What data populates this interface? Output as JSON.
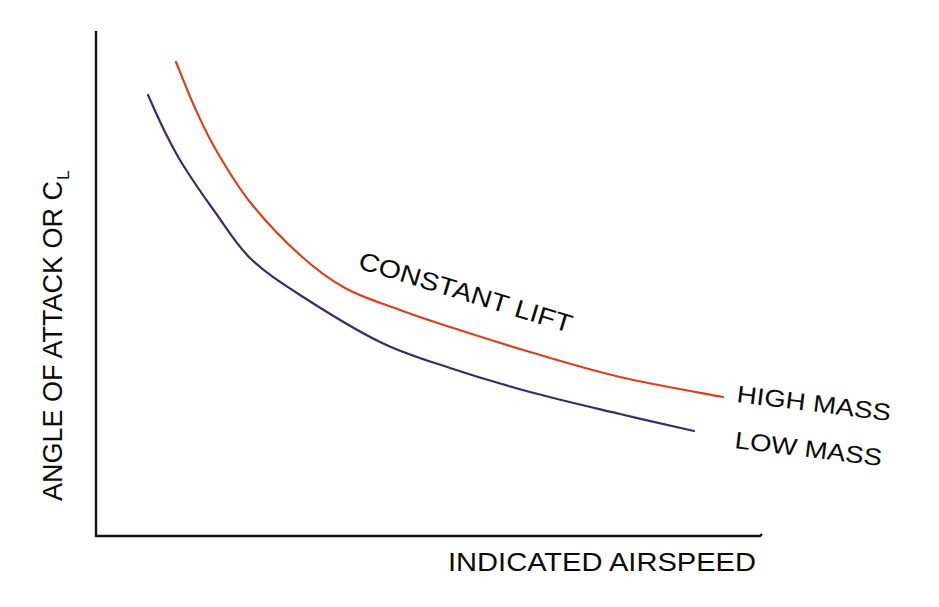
{
  "chart_data": {
    "type": "line",
    "title": "",
    "xlabel": "INDICATED AIRSPEED",
    "ylabel": "ANGLE OF ATTACK OR C",
    "ylabel_subscript": "L",
    "grid": false,
    "legend": "inline labels at curve ends",
    "annotations": [
      {
        "text": "CONSTANT LIFT",
        "position": "above high-mass curve, mid-chart",
        "rotation_deg": 17
      }
    ],
    "axis_ticks": "none (qualitative diagram)",
    "series": [
      {
        "name": "HIGH MASS",
        "color": "#d8401f",
        "points_px": [
          [
            176,
            62
          ],
          [
            195,
            108
          ],
          [
            216,
            150
          ],
          [
            250,
            202
          ],
          [
            300,
            255
          ],
          [
            345,
            288
          ],
          [
            400,
            310
          ],
          [
            450,
            327
          ],
          [
            530,
            352
          ],
          [
            620,
            377
          ],
          [
            723,
            397
          ]
        ]
      },
      {
        "name": "LOW MASS",
        "color": "#3d2a6b",
        "points_px": [
          [
            148,
            95
          ],
          [
            165,
            132
          ],
          [
            183,
            165
          ],
          [
            215,
            212
          ],
          [
            250,
            258
          ],
          [
            300,
            295
          ],
          [
            380,
            342
          ],
          [
            450,
            368
          ],
          [
            530,
            392
          ],
          [
            620,
            414
          ],
          [
            694,
            431
          ]
        ]
      }
    ],
    "relationship": "angle of attack decreases as indicated airspeed increases; higher mass requires higher angle of attack at a given airspeed"
  },
  "labels": {
    "x_axis": "INDICATED AIRSPEED",
    "y_axis_main": "ANGLE OF ATTACK OR C",
    "y_axis_sub": "L",
    "annotation": "CONSTANT LIFT",
    "high_mass": "HIGH MASS",
    "low_mass": "LOW MASS"
  },
  "colors": {
    "high_mass": "#d8401f",
    "low_mass": "#3d2a6b",
    "axis": "#111111",
    "text": "#0a0a0a",
    "background": "#ffffff"
  }
}
